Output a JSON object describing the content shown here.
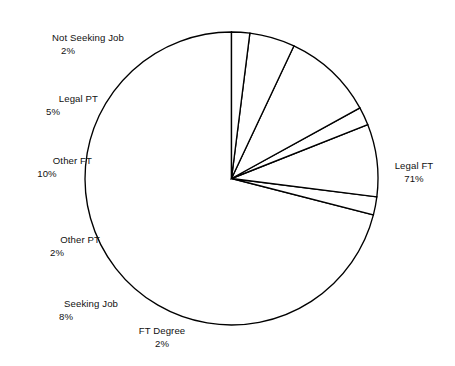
{
  "chart_data": {
    "type": "pie",
    "title": "",
    "subtitle": "",
    "xlabel": "",
    "ylabel": "",
    "legend_position": "none",
    "grid": false,
    "value_unit": "%",
    "start_angle_deg": 90,
    "direction": "counterclockwise",
    "categories": [
      "Legal FT",
      "FT Degree",
      "Seeking Job",
      "Other PT",
      "Other FT",
      "Legal PT",
      "Not Seeking Job"
    ],
    "values": [
      71,
      2,
      8,
      2,
      10,
      5,
      2
    ],
    "slices": [
      {
        "label": "Legal FT",
        "value": 71,
        "value_text": "71%"
      },
      {
        "label": "FT Degree",
        "value": 2,
        "value_text": "2%"
      },
      {
        "label": "Seeking Job",
        "value": 8,
        "value_text": "8%"
      },
      {
        "label": "Other PT",
        "value": 2,
        "value_text": "2%"
      },
      {
        "label": "Other FT",
        "value": 10,
        "value_text": "10%"
      },
      {
        "label": "Legal PT",
        "value": 5,
        "value_text": "5%"
      },
      {
        "label": "Not Seeking Job",
        "value": 2,
        "value_text": "2%"
      }
    ],
    "colors": {
      "slice_fill": "#ffffff",
      "slice_stroke": "#000000",
      "background": "#ffffff",
      "text": "#111111"
    }
  },
  "labels": {
    "not_seeking_job": {
      "name": "Not Seeking Job",
      "value_text": "2%"
    },
    "legal_pt": {
      "name": "Legal PT",
      "value_text": "5%"
    },
    "other_ft": {
      "name": "Other FT",
      "value_text": "10%"
    },
    "other_pt": {
      "name": "Other PT",
      "value_text": "2%"
    },
    "seeking_job": {
      "name": "Seeking Job",
      "value_text": "8%"
    },
    "ft_degree": {
      "name": "FT Degree",
      "value_text": "2%"
    },
    "legal_ft": {
      "name": "Legal FT",
      "value_text": "71%"
    }
  }
}
